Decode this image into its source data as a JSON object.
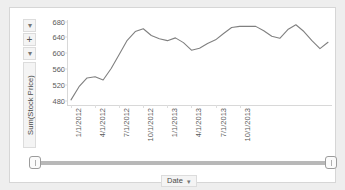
{
  "panel": {
    "background": "#ffffff",
    "border_color": "#d6d6d6"
  },
  "y_axis": {
    "title": "Sum(Stock Price)",
    "controls": [
      {
        "name": "caret-top",
        "glyph": "▾"
      },
      {
        "name": "expand-plus",
        "glyph": "+"
      },
      {
        "name": "caret-bottom",
        "glyph": "▾"
      }
    ]
  },
  "x_axis": {
    "title": "Date",
    "dropdown_caret": "▾"
  },
  "slider": {
    "left_handle": "left-range-handle",
    "right_handle": "right-range-handle"
  },
  "chart_data": {
    "type": "line",
    "title": "",
    "xlabel": "Date",
    "ylabel": "Sum(Stock Price)",
    "ylim": [
      470,
      684
    ],
    "yticks": [
      480,
      520,
      560,
      600,
      640,
      680
    ],
    "xticks": [
      "1/1/2012",
      "4/1/2012",
      "7/1/2012",
      "10/1/2012",
      "1/1/2013",
      "4/1/2013",
      "7/1/2013",
      "10/1/2013"
    ],
    "grid": false,
    "legend": "none",
    "line_color": "#808080",
    "series": [
      {
        "name": "Sum(Stock Price)",
        "x": [
          "1/1/2012",
          "2/1/2012",
          "3/1/2012",
          "4/1/2012",
          "5/1/2012",
          "6/1/2012",
          "7/1/2012",
          "8/1/2012",
          "9/1/2012",
          "10/1/2012",
          "11/1/2012",
          "12/1/2012",
          "1/1/2013",
          "2/1/2013",
          "3/1/2013",
          "4/1/2013",
          "5/1/2013",
          "6/1/2013",
          "7/1/2013",
          "8/1/2013",
          "9/1/2013",
          "10/1/2013",
          "11/1/2013",
          "12/1/2013"
        ],
        "values": [
          483,
          516,
          538,
          541,
          533,
          562,
          597,
          633,
          655,
          662,
          645,
          637,
          632,
          639,
          627,
          608,
          613,
          625,
          634,
          650,
          665,
          668,
          668,
          668
        ]
      }
    ],
    "values_extended": [
      483,
      516,
      538,
      541,
      533,
      562,
      597,
      633,
      655,
      662,
      645,
      637,
      632,
      639,
      627,
      608,
      613,
      625,
      634,
      650,
      665,
      668,
      668,
      668,
      657,
      643,
      638,
      660,
      672,
      655,
      632,
      612,
      628
    ]
  }
}
